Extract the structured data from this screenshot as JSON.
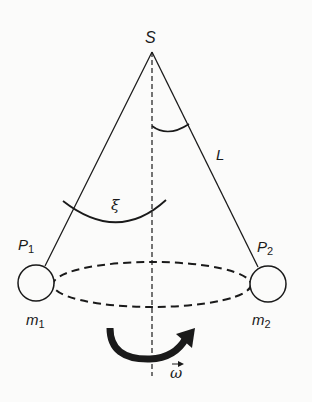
{
  "diagram": {
    "type": "conical-pendulum",
    "labels": {
      "pivot": "S",
      "length": "L",
      "angle": "ξ",
      "point1": "P",
      "point1_sub": "1",
      "point2": "P",
      "point2_sub": "2",
      "mass1": "m",
      "mass1_sub": "1",
      "mass2": "m",
      "mass2_sub": "2",
      "angular_velocity": "ω"
    },
    "colors": {
      "stroke": "#1a1a1a",
      "background": "#fbfbfa"
    }
  }
}
